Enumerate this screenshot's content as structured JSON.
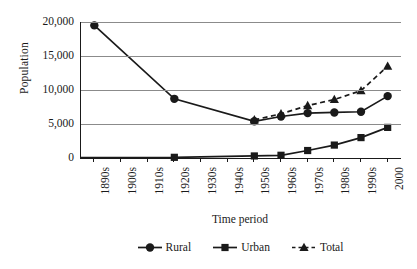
{
  "chart_data": {
    "type": "line",
    "title": "",
    "xlabel": "Time period",
    "ylabel": "Population",
    "categories": [
      "1890s",
      "1900s",
      "1910s",
      "1920s",
      "1930s",
      "1940s",
      "1950s",
      "1960s",
      "1970s",
      "1980s",
      "1990s",
      "2000"
    ],
    "ylim": [
      0,
      20000
    ],
    "yticks": [
      0,
      5000,
      10000,
      15000,
      20000
    ],
    "ytick_labels": [
      "0",
      "5,000",
      "10,000",
      "15,000",
      "20,000"
    ],
    "grid": "horizontal",
    "legend_position": "bottom-center",
    "series": [
      {
        "name": "Rural",
        "marker": "circle",
        "line": "solid",
        "color": "#1a1a1a",
        "x": [
          "1890s",
          "1920s",
          "1950s",
          "1960s",
          "1970s",
          "1980s",
          "1990s",
          "2000"
        ],
        "values": [
          19500,
          8700,
          5400,
          6100,
          6600,
          6700,
          6800,
          9100
        ]
      },
      {
        "name": "Urban",
        "marker": "square",
        "line": "solid",
        "color": "#1a1a1a",
        "x": [
          "1920s",
          "1950s",
          "1960s",
          "1970s",
          "1980s",
          "1990s",
          "2000"
        ],
        "values": [
          100,
          300,
          400,
          1100,
          1900,
          3000,
          4500
        ]
      },
      {
        "name": "Total",
        "marker": "triangle",
        "line": "dashed",
        "color": "#1a1a1a",
        "x": [
          "1950s",
          "1960s",
          "1970s",
          "1980s",
          "1990s",
          "2000"
        ],
        "values": [
          5600,
          6500,
          7700,
          8600,
          9900,
          13500
        ]
      }
    ]
  },
  "axes": {
    "ylabel": "Population",
    "xlabel": "Time period",
    "ytick_labels": [
      "20,000",
      "15,000",
      "10,000",
      "5,000",
      "0"
    ],
    "xtick_labels": [
      "1890s",
      "1900s",
      "1910s",
      "1920s",
      "1930s",
      "1940s",
      "1950s",
      "1960s",
      "1970s",
      "1980s",
      "1990s",
      "2000"
    ]
  },
  "legend": {
    "items": [
      {
        "label": "Rural",
        "marker": "circle-marker",
        "style": "solid"
      },
      {
        "label": "Urban",
        "marker": "square-marker",
        "style": "solid"
      },
      {
        "label": "Total",
        "marker": "triangle-marker",
        "style": "dashed"
      }
    ]
  },
  "colors": {
    "ink": "#1a1a1a",
    "gridline": "#8b8b8b",
    "background": "#ffffff"
  }
}
